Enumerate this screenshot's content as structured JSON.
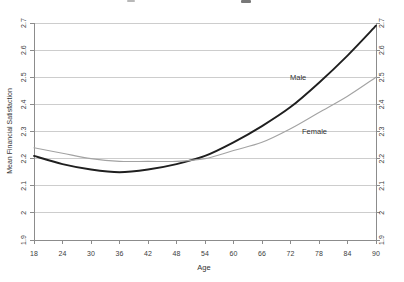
{
  "chart_data": {
    "type": "line",
    "xlabel": "Age",
    "ylabel": "Mean Financial Satisfaction",
    "xlim": [
      18,
      90
    ],
    "ylim": [
      1.9,
      2.7
    ],
    "x": [
      18,
      24,
      30,
      36,
      42,
      48,
      54,
      60,
      66,
      72,
      78,
      84,
      90
    ],
    "series": [
      {
        "name": "Male",
        "color": "#1f1f1f",
        "stroke_width": 1.9,
        "values": [
          2.21,
          2.18,
          2.16,
          2.15,
          2.16,
          2.18,
          2.21,
          2.26,
          2.32,
          2.39,
          2.48,
          2.58,
          2.69
        ]
      },
      {
        "name": "Female",
        "color": "#a3a3a3",
        "stroke_width": 1.1,
        "values": [
          2.24,
          2.22,
          2.2,
          2.19,
          2.19,
          2.19,
          2.2,
          2.23,
          2.26,
          2.31,
          2.37,
          2.43,
          2.5
        ]
      }
    ],
    "x_ticks": {
      "values": [
        18,
        24,
        30,
        36,
        42,
        48,
        54,
        60,
        66,
        72,
        78,
        84,
        90
      ],
      "labels": [
        "18",
        "24",
        "30",
        "36",
        "42",
        "48",
        "54",
        "60",
        "66",
        "72",
        "78",
        "84",
        "90"
      ]
    },
    "y_ticks": {
      "values": [
        1.9,
        2.0,
        2.1,
        2.2,
        2.3,
        2.4,
        2.5,
        2.6,
        2.7
      ],
      "labels": [
        "1.9",
        "2",
        "2.1",
        "2.2",
        "2.3",
        "2.4",
        "2.5",
        "2.6",
        "2.7"
      ]
    },
    "grid": "horizontal",
    "legend": "inline-curve-labels",
    "y_tick_labels_rotated": true,
    "y_ticks_on_both_sides": true
  },
  "colors": {
    "background": "#ffffff",
    "gridline": "#cdcdcd",
    "axis": "#8c8c8c",
    "tick_text": "#3d3d3d",
    "label_text": "#333333"
  }
}
